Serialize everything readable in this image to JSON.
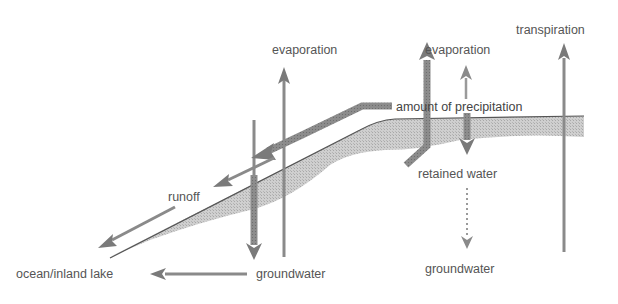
{
  "diagram": {
    "type": "water-cycle-schematic",
    "colors": {
      "arrow": "#8a8a8a",
      "arrow_dark": "#7a7a7a",
      "ground_fill": "#c9c9c9",
      "ground_edge": "#555555",
      "text": "#555555",
      "background": "#ffffff"
    },
    "labels": {
      "evaporation_left": "evaporation",
      "evaporation_right": "evaporation",
      "transpiration": "transpiration",
      "amount_of_precipitation": "amount of precipitation",
      "runoff": "runoff",
      "retained_water": "retained water",
      "groundwater_left": "groundwater",
      "groundwater_right": "groundwater",
      "ocean_inland_lake": "ocean/inland lake"
    },
    "arrows": [
      {
        "id": "evaporation-left-arrow",
        "direction": "up"
      },
      {
        "id": "infiltration-left-arrow",
        "direction": "down"
      },
      {
        "id": "precipitation-flow-arrow",
        "direction": "down-left"
      },
      {
        "id": "runoff-upper-arrow",
        "direction": "down-left"
      },
      {
        "id": "runoff-lower-arrow",
        "direction": "down-left"
      },
      {
        "id": "groundwater-to-ocean-arrow",
        "direction": "left"
      },
      {
        "id": "evaporation-right-arrow",
        "direction": "up"
      },
      {
        "id": "retained-water-arrow",
        "direction": "down"
      },
      {
        "id": "retained-to-groundwater-dotted-arrow",
        "direction": "down"
      },
      {
        "id": "transpiration-thick-arrow",
        "direction": "up"
      },
      {
        "id": "transpiration-thin-arrow",
        "direction": "up"
      }
    ]
  }
}
